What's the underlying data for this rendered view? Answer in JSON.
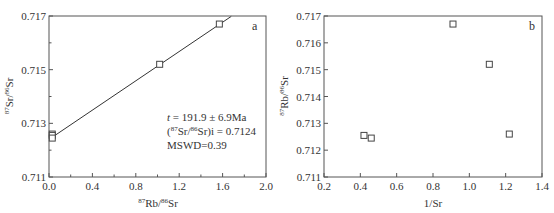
{
  "chart_data": [
    {
      "id": "a",
      "type": "scatter",
      "panel_label": "a",
      "title": "",
      "xlabel": "87Rb/86Sr",
      "ylabel": "87Sr/86Sr",
      "xlim": [
        0.0,
        2.0
      ],
      "ylim": [
        0.711,
        0.717
      ],
      "xticks": [
        "0.0",
        "0.4",
        "0.8",
        "1.2",
        "1.6",
        "2.0"
      ],
      "xminor": [
        0.2,
        0.6,
        1.0,
        1.4,
        1.8
      ],
      "yticks": [
        "0.711",
        "0.713",
        "0.715",
        "0.717"
      ],
      "yminor": [
        0.712,
        0.714,
        0.716
      ],
      "grid": false,
      "legend": null,
      "marker": "open-square",
      "series": [
        {
          "name": "samples",
          "x": [
            0.03,
            0.03,
            0.03,
            1.02,
            1.57
          ],
          "y": [
            0.7126,
            0.71255,
            0.71245,
            0.7152,
            0.7167
          ]
        }
      ],
      "fit_line": {
        "intercept": 0.7124,
        "slope": 0.00273,
        "x_start": 0.0,
        "x_end": 1.68
      },
      "annotations": {
        "age": "t = 191.9 ± 6.9Ma",
        "initial_ratio": "(87Sr/86Sr)i = 0.7124",
        "mswd": "MSWD=0.39"
      }
    },
    {
      "id": "b",
      "type": "scatter",
      "panel_label": "b",
      "title": "",
      "xlabel": "1/Sr",
      "ylabel": "87Rb/86Sr",
      "xlim": [
        0.2,
        1.4
      ],
      "ylim": [
        0.711,
        0.717
      ],
      "xticks": [
        "0.2",
        "0.4",
        "0.6",
        "0.8",
        "1.0",
        "1.2",
        "1.4"
      ],
      "yticks": [
        "0.711",
        "0.712",
        "0.713",
        "0.714",
        "0.715",
        "0.716",
        "0.717"
      ],
      "grid": false,
      "legend": null,
      "marker": "open-square",
      "series": [
        {
          "name": "samples",
          "x": [
            0.42,
            0.46,
            0.91,
            1.11,
            1.22
          ],
          "y": [
            0.71255,
            0.71245,
            0.7167,
            0.7152,
            0.7126
          ]
        }
      ]
    }
  ],
  "labels": {
    "a": {
      "panel": "a",
      "xlabel_sup1": "87",
      "xlabel_main1": "Rb/",
      "xlabel_sup2": "86",
      "xlabel_main2": "Sr",
      "ylabel_sup1": "87",
      "ylabel_main1": "Sr/",
      "ylabel_sup2": "86",
      "ylabel_main2": "Sr",
      "annot_t_italic": "t",
      "annot_t_rest": " = 191.9 ± 6.9Ma",
      "annot_i_open": "(",
      "annot_i_sup1": "87",
      "annot_i_mid": "Sr/",
      "annot_i_sup2": "86",
      "annot_i_rest": "Sr)i = 0.7124",
      "annot_mswd": "MSWD=0.39"
    },
    "b": {
      "panel": "b",
      "xlabel": "1/Sr",
      "ylabel_sup1": "87",
      "ylabel_main1": "Rb/",
      "ylabel_sup2": "86",
      "ylabel_main2": "Sr"
    }
  }
}
